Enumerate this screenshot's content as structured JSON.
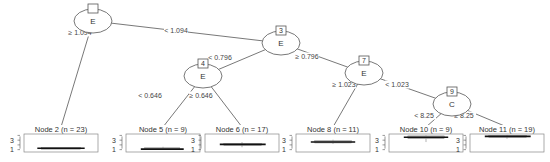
{
  "diagram": {
    "type": "decision-tree",
    "style": "conditional inference tree (boxplot terminals)",
    "colors": {
      "line": "#555555",
      "box_border": "#888888",
      "median": "#111111",
      "box_fill": "#bbbbbb"
    },
    "inner_nodes": [
      {
        "id": "1",
        "variable": "E",
        "cx": 93,
        "cy": 21,
        "show_id": false
      },
      {
        "id": "3",
        "variable": "E",
        "cx": 281,
        "cy": 43,
        "show_id": true
      },
      {
        "id": "4",
        "variable": "E",
        "cx": 203,
        "cy": 76,
        "show_id": true
      },
      {
        "id": "7",
        "variable": "E",
        "cx": 364,
        "cy": 73,
        "show_id": true
      },
      {
        "id": "9",
        "variable": "C",
        "cx": 452,
        "cy": 104,
        "show_id": true
      }
    ],
    "edges": [
      {
        "from": "1",
        "to": "2",
        "label": "≥ 1.094",
        "lx": 80,
        "ly": 35
      },
      {
        "from": "1",
        "to": "3",
        "label": "< 1.094",
        "lx": 176,
        "ly": 33
      },
      {
        "from": "3",
        "to": "4",
        "label": "< 0.796",
        "lx": 220,
        "ly": 60
      },
      {
        "from": "3",
        "to": "7",
        "label": "≥ 0.796",
        "lx": 307,
        "ly": 59
      },
      {
        "from": "4",
        "to": "5",
        "label": "< 0.646",
        "lx": 150,
        "ly": 98
      },
      {
        "from": "4",
        "to": "6",
        "label": "≥ 0.646",
        "lx": 201,
        "ly": 98
      },
      {
        "from": "7",
        "to": "8",
        "label": "≥ 1.023",
        "lx": 344,
        "ly": 87
      },
      {
        "from": "7",
        "to": "9",
        "label": "< 1.023",
        "lx": 397,
        "ly": 87
      },
      {
        "from": "9",
        "to": "10",
        "label": "< 8.25",
        "lx": 424,
        "ly": 118
      },
      {
        "from": "9",
        "to": "11",
        "label": "≥ 8.25",
        "lx": 464,
        "ly": 118
      }
    ],
    "terminal_nodes": [
      {
        "id": "2",
        "title": "Node 2 (n = 23)",
        "x": 24,
        "median": 1.3,
        "q1": 1.1,
        "q3": 1.5,
        "wlo": 1.2,
        "whi": 1.2,
        "wmin_x": 0.18,
        "wmax_x": 0.82
      },
      {
        "id": "5",
        "title": "Node 5 (n = 9)",
        "x": 126,
        "median": 1.1,
        "q1": 1.0,
        "q3": 1.4,
        "wlo": 1.0,
        "whi": 1.6,
        "wmin_x": 0.2,
        "wmax_x": 0.78
      },
      {
        "id": "6",
        "title": "Node 6 (n = 17)",
        "x": 205,
        "median": 2.1,
        "q1": 1.9,
        "q3": 2.3,
        "wlo": 1.5,
        "whi": 2.6,
        "wmin_x": 0.2,
        "wmax_x": 0.82
      },
      {
        "id": "8",
        "title": "Node 8 (n = 11)",
        "x": 296,
        "median": 2.6,
        "q1": 2.4,
        "q3": 2.9,
        "wlo": 2.2,
        "whi": 3.1,
        "wmin_x": 0.2,
        "wmax_x": 0.8
      },
      {
        "id": "10",
        "title": "Node 10 (n = 9)",
        "x": 389,
        "median": 3.6,
        "q1": 3.3,
        "q3": 3.9,
        "wlo": 2.6,
        "whi": 4.0,
        "wmin_x": 0.2,
        "wmax_x": 0.8
      },
      {
        "id": "11",
        "title": "Node 11 (n = 19)",
        "x": 470,
        "median": 3.8,
        "q1": 3.6,
        "q3": 4.0,
        "wlo": 3.3,
        "whi": 4.1,
        "wmin_x": 0.2,
        "wmax_x": 0.82
      }
    ],
    "terminal_axis": {
      "ticks": [
        "3",
        "1"
      ],
      "tick_values": [
        3,
        1
      ],
      "ylim": [
        0.5,
        4.3
      ]
    }
  }
}
